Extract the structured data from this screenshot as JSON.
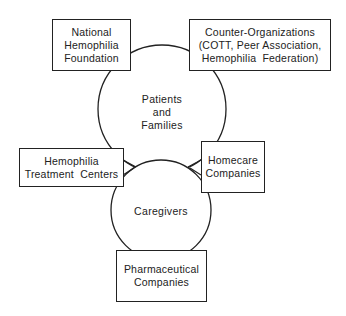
{
  "diagram": {
    "title": "",
    "circles": [
      {
        "id": "patients",
        "lines": [
          "Patients",
          "and",
          "Families"
        ]
      },
      {
        "id": "caregivers",
        "lines": [
          "Caregivers"
        ]
      }
    ],
    "boxes": {
      "nhf": {
        "lines": [
          "National",
          "Hemophilia",
          "Foundation"
        ]
      },
      "counter": {
        "lines": [
          "Counter-Organizations",
          "(COTT, Peer Association,",
          "Hemophilia  Federation)"
        ]
      },
      "htc": {
        "lines": [
          "Hemophilia",
          "Treatment  Centers"
        ]
      },
      "homecare": {
        "lines": [
          "Homecare",
          "Companies"
        ]
      },
      "pharma": {
        "lines": [
          "Pharmaceutical",
          "Companies"
        ]
      }
    },
    "colors": {
      "stroke": "#222222",
      "fill": "#ffffff"
    }
  }
}
